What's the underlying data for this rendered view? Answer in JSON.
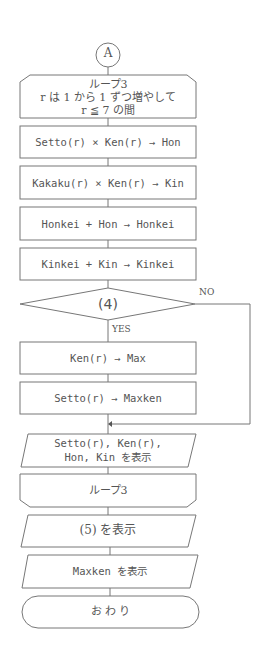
{
  "connector": {
    "label": "A"
  },
  "loop_start": {
    "title": "ループ3",
    "line1": "r は 1 から 1 ずつ増やして",
    "line2": "r ≦ 7 の間"
  },
  "steps": [
    "Setto(r) × Ken(r) → Hon",
    "Kakaku(r) × Ken(r) → Kin",
    "Honkei + Hon → Honkei",
    "Kinkei + Kin → Kinkei"
  ],
  "decision": {
    "label": "(4)",
    "yes": "YES",
    "no": "NO"
  },
  "yes_steps": [
    "Ken(r) → Max",
    "Setto(r) → Maxken"
  ],
  "display1": {
    "line1": "Setto(r), Ken(r),",
    "line2": "Hon, Kin を表示"
  },
  "loop_end": {
    "label": "ループ3"
  },
  "display2": {
    "label": "(5) を表示"
  },
  "display3": {
    "label": "Maxken を表示"
  },
  "terminal": {
    "label": "お わ り"
  }
}
